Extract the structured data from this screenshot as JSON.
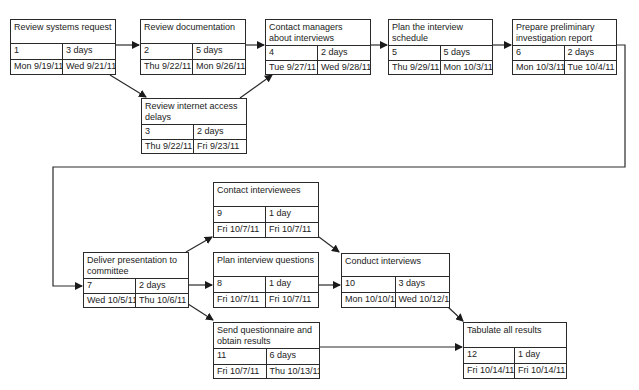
{
  "diagram": {
    "type": "pert-network",
    "nodes": [
      {
        "id": 1,
        "title": "Review systems request",
        "task": "1",
        "duration": "3 days",
        "start": "Mon 9/19/11",
        "finish": "Wed 9/21/11"
      },
      {
        "id": 2,
        "title": "Review documentation",
        "task": "2",
        "duration": "5 days",
        "start": "Thu 9/22/11",
        "finish": "Mon 9/26/11"
      },
      {
        "id": 3,
        "title": "Review internet access delays",
        "task": "3",
        "duration": "2 days",
        "start": "Thu 9/22/11",
        "finish": "Fri 9/23/11"
      },
      {
        "id": 4,
        "title": "Contact managers about interviews",
        "task": "4",
        "duration": "2 days",
        "start": "Tue 9/27/11",
        "finish": "Wed 9/28/11"
      },
      {
        "id": 5,
        "title": "Plan the interview schedule",
        "task": "5",
        "duration": "5 days",
        "start": "Thu 9/29/11",
        "finish": "Mon 10/3/11"
      },
      {
        "id": 6,
        "title": "Prepare preliminary investigation report",
        "task": "6",
        "duration": "2 days",
        "start": "Mon 10/3/11",
        "finish": "Tue 10/4/11"
      },
      {
        "id": 7,
        "title": "Deliver presentation to committee",
        "task": "7",
        "duration": "2 days",
        "start": "Wed 10/5/11",
        "finish": "Thu 10/6/11"
      },
      {
        "id": 8,
        "title": "Plan interview questions",
        "task": "8",
        "duration": "1 day",
        "start": "Fri 10/7/11",
        "finish": "Fri 10/7/11"
      },
      {
        "id": 9,
        "title": "Contact interviewees",
        "task": "9",
        "duration": "1 day",
        "start": "Fri 10/7/11",
        "finish": "Fri 10/7/11"
      },
      {
        "id": 10,
        "title": "Conduct interviews",
        "task": "10",
        "duration": "3 days",
        "start": "Mon 10/10/11",
        "finish": "Wed 10/12/11"
      },
      {
        "id": 11,
        "title": "Send questionnaire and obtain results",
        "task": "11",
        "duration": "6 days",
        "start": "Fri 10/7/11",
        "finish": "Thu 10/13/11"
      },
      {
        "id": 12,
        "title": "Tabulate all results",
        "task": "12",
        "duration": "1 day",
        "start": "Fri 10/14/11",
        "finish": "Fri 10/14/11"
      }
    ],
    "edges": [
      {
        "from": 1,
        "to": 2
      },
      {
        "from": 1,
        "to": 3
      },
      {
        "from": 2,
        "to": 4
      },
      {
        "from": 3,
        "to": 4
      },
      {
        "from": 4,
        "to": 5
      },
      {
        "from": 5,
        "to": 6
      },
      {
        "from": 6,
        "to": 7
      },
      {
        "from": 7,
        "to": 9
      },
      {
        "from": 7,
        "to": 8
      },
      {
        "from": 7,
        "to": 11
      },
      {
        "from": 9,
        "to": 10
      },
      {
        "from": 8,
        "to": 10
      },
      {
        "from": 10,
        "to": 12
      },
      {
        "from": 11,
        "to": 12
      }
    ],
    "colors": {
      "line": "#2a2a2a",
      "background": "#ffffff"
    }
  }
}
